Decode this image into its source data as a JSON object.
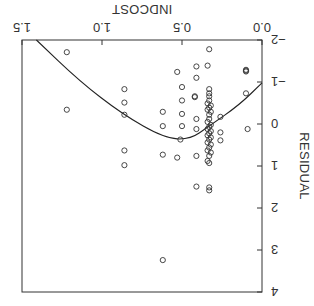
{
  "chart_data": {
    "type": "scatter",
    "title": "",
    "xlabel": "INDCOST",
    "ylabel": "RESIDUAL",
    "xlim": [
      0.0,
      1.5
    ],
    "ylim": [
      -2,
      4
    ],
    "xticks": [
      "0.0",
      "0.5",
      "1.0",
      "1.5"
    ],
    "yticks": [
      "-2",
      "-1",
      "0",
      "1",
      "2",
      "3",
      "4"
    ],
    "grid": false,
    "legend": null,
    "orientation_note": "image displayed rotated 180 degrees",
    "series": [
      {
        "name": "observations",
        "marker": "open-circle",
        "points": [
          [
            1.22,
            -1.71
          ],
          [
            1.22,
            -0.34
          ],
          [
            0.86,
            -0.83
          ],
          [
            0.86,
            -0.51
          ],
          [
            0.86,
            -0.22
          ],
          [
            0.86,
            0.63
          ],
          [
            0.86,
            0.98
          ],
          [
            0.62,
            -0.29
          ],
          [
            0.62,
            0.05
          ],
          [
            0.62,
            0.73
          ],
          [
            0.62,
            3.24
          ],
          [
            0.53,
            -1.24
          ],
          [
            0.53,
            0.8
          ],
          [
            0.5,
            -0.88
          ],
          [
            0.5,
            -0.56
          ],
          [
            0.5,
            -0.24
          ],
          [
            0.5,
            0.05
          ],
          [
            0.51,
            0.37
          ],
          [
            0.41,
            -1.37
          ],
          [
            0.41,
            -1.1
          ],
          [
            0.42,
            -0.66
          ],
          [
            0.42,
            -0.64
          ],
          [
            0.41,
            -0.12
          ],
          [
            0.41,
            0.12
          ],
          [
            0.41,
            0.76
          ],
          [
            0.41,
            1.49
          ],
          [
            0.34,
            -1.39
          ],
          [
            0.33,
            -1.78
          ],
          [
            0.33,
            -0.83
          ],
          [
            0.33,
            -0.73
          ],
          [
            0.33,
            -0.66
          ],
          [
            0.33,
            -0.56
          ],
          [
            0.34,
            -0.49
          ],
          [
            0.32,
            -0.44
          ],
          [
            0.33,
            -0.39
          ],
          [
            0.34,
            -0.34
          ],
          [
            0.32,
            -0.29
          ],
          [
            0.33,
            -0.22
          ],
          [
            0.33,
            -0.12
          ],
          [
            0.34,
            -0.05
          ],
          [
            0.32,
            0.02
          ],
          [
            0.33,
            0.07
          ],
          [
            0.34,
            0.12
          ],
          [
            0.32,
            0.17
          ],
          [
            0.33,
            0.22
          ],
          [
            0.34,
            0.27
          ],
          [
            0.32,
            0.32
          ],
          [
            0.33,
            0.37
          ],
          [
            0.34,
            0.44
          ],
          [
            0.32,
            0.49
          ],
          [
            0.33,
            0.56
          ],
          [
            0.34,
            0.63
          ],
          [
            0.32,
            0.68
          ],
          [
            0.33,
            0.76
          ],
          [
            0.34,
            0.88
          ],
          [
            0.33,
            0.93
          ],
          [
            0.33,
            1.51
          ],
          [
            0.33,
            1.58
          ],
          [
            0.26,
            -0.17
          ],
          [
            0.26,
            0.2
          ],
          [
            0.26,
            0.39
          ],
          [
            0.1,
            -1.29
          ],
          [
            0.1,
            -1.27
          ],
          [
            0.1,
            -1.25
          ],
          [
            0.1,
            -0.73
          ],
          [
            0.09,
            0.12
          ]
        ]
      },
      {
        "name": "fitted curve",
        "type": "line",
        "points": [
          [
            1.41,
            -2.0
          ],
          [
            1.14,
            -1.02
          ],
          [
            0.875,
            -0.24
          ],
          [
            0.61,
            0.34
          ],
          [
            0.45,
            0.37
          ],
          [
            0.33,
            0.05
          ],
          [
            0.14,
            -0.46
          ],
          [
            0.0,
            -0.98
          ]
        ]
      }
    ]
  },
  "axes": {
    "x_title": "INDCOST",
    "y_title": "RESIDUAL"
  }
}
